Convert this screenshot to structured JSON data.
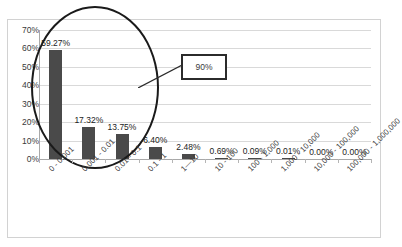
{
  "chart_data": {
    "type": "bar",
    "title": "",
    "xlabel": "",
    "ylabel": "",
    "grid": true,
    "legend": false,
    "ylim": [
      0,
      70
    ],
    "ytick_labels": [
      "70%",
      "60%",
      "50%",
      "40%",
      "30%",
      "20%",
      "10%",
      "0%"
    ],
    "ytick_values": [
      70,
      60,
      50,
      40,
      30,
      20,
      10,
      0
    ],
    "categories": [
      "0 - 0.001",
      "0.001 - 0.01",
      "0.01 - 0.1",
      "0.1 - 1",
      "1—10",
      "10 - 100",
      "100 - 1,000",
      "1,000 - 10,000",
      "10,000 - 100,000",
      "100,000 - 1,000,000"
    ],
    "values": [
      59.27,
      17.32,
      13.75,
      6.4,
      2.48,
      0.69,
      0.09,
      0.01,
      0.0,
      0.0
    ],
    "data_labels": [
      "59.27%",
      "17.32%",
      "13.75%",
      "6.40%",
      "2.48%",
      "0.69%",
      "0.09%",
      "0.01%",
      "0.00%",
      "0.00%"
    ],
    "bar_color": "#4a4a4a",
    "grid_color": "#d9d9d9"
  },
  "annotations": {
    "callout_label": "90%",
    "highlight_shape": "ellipse"
  }
}
